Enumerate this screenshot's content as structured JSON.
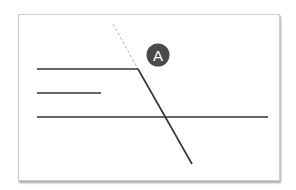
{
  "diagram": {
    "marker": {
      "label": "A",
      "fill": "#4a4a4a",
      "text_color": "#ffffff"
    },
    "colors": {
      "line": "#333333",
      "dashed": "#bbbbbb",
      "card_border": "#cfcfcf"
    },
    "lines": [
      {
        "name": "top-horizontal",
        "x1": 37,
        "y1": 69,
        "x2": 138,
        "y2": 69
      },
      {
        "name": "middle-short",
        "x1": 37,
        "y1": 93,
        "x2": 101,
        "y2": 93
      },
      {
        "name": "bottom-long",
        "x1": 37,
        "y1": 117,
        "x2": 268,
        "y2": 117
      },
      {
        "name": "diagonal",
        "x1": 138,
        "y1": 69,
        "x2": 192,
        "y2": 164
      }
    ],
    "dashed_extension": {
      "x1": 113,
      "y1": 24,
      "x2": 138,
      "y2": 69
    }
  }
}
